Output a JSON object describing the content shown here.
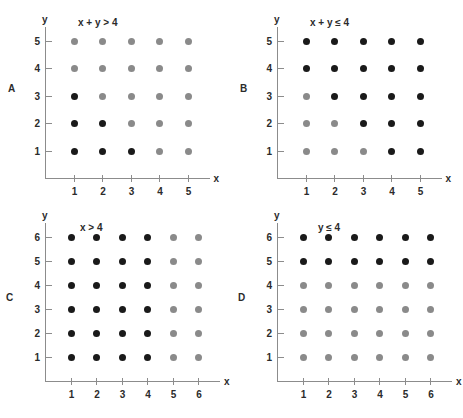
{
  "figure": {
    "width": 463,
    "height": 418,
    "background": "#ffffff",
    "colors": {
      "dot_true": "#1a1a1a",
      "dot_false": "#8a8a8a",
      "axis": "#8c8c8c",
      "text": "#2b2b2b"
    }
  },
  "chart_data": [
    {
      "type": "scatter",
      "panel": "A",
      "panel_label": "A",
      "title": "x + y > 4",
      "xlabel": "x",
      "ylabel": "y",
      "xticks": [
        1,
        2,
        3,
        4,
        5
      ],
      "yticks": [
        1,
        2,
        3,
        4,
        5
      ],
      "xlim": [
        0,
        6
      ],
      "ylim": [
        0,
        6
      ],
      "grid": false,
      "legend": "none",
      "series": [
        {
          "name": "black-dots",
          "color": "#1a1a1a",
          "meaning": "x + y <= 4",
          "points": [
            [
              1,
              1
            ],
            [
              2,
              1
            ],
            [
              3,
              1
            ],
            [
              1,
              2
            ],
            [
              2,
              2
            ],
            [
              1,
              3
            ]
          ]
        },
        {
          "name": "gray-dots",
          "color": "#8a8a8a",
          "meaning": "x + y > 4",
          "points": [
            [
              4,
              1
            ],
            [
              5,
              1
            ],
            [
              3,
              2
            ],
            [
              4,
              2
            ],
            [
              5,
              2
            ],
            [
              2,
              3
            ],
            [
              3,
              3
            ],
            [
              4,
              3
            ],
            [
              5,
              3
            ],
            [
              1,
              4
            ],
            [
              2,
              4
            ],
            [
              3,
              4
            ],
            [
              4,
              4
            ],
            [
              5,
              4
            ],
            [
              1,
              5
            ],
            [
              2,
              5
            ],
            [
              3,
              5
            ],
            [
              4,
              5
            ],
            [
              5,
              5
            ]
          ]
        }
      ]
    },
    {
      "type": "scatter",
      "panel": "B",
      "panel_label": "B",
      "title": "x + y ≤ 4",
      "xlabel": "x",
      "ylabel": "y",
      "xticks": [
        1,
        2,
        3,
        4,
        5
      ],
      "yticks": [
        1,
        2,
        3,
        4,
        5
      ],
      "xlim": [
        0,
        6
      ],
      "ylim": [
        0,
        6
      ],
      "grid": false,
      "legend": "none",
      "series": [
        {
          "name": "black-dots",
          "color": "#1a1a1a",
          "meaning": "x + y > 4",
          "points": [
            [
              4,
              1
            ],
            [
              5,
              1
            ],
            [
              3,
              2
            ],
            [
              4,
              2
            ],
            [
              5,
              2
            ],
            [
              2,
              3
            ],
            [
              3,
              3
            ],
            [
              4,
              3
            ],
            [
              5,
              3
            ],
            [
              1,
              4
            ],
            [
              2,
              4
            ],
            [
              3,
              4
            ],
            [
              4,
              4
            ],
            [
              5,
              4
            ],
            [
              1,
              5
            ],
            [
              2,
              5
            ],
            [
              3,
              5
            ],
            [
              4,
              5
            ],
            [
              5,
              5
            ]
          ]
        },
        {
          "name": "gray-dots",
          "color": "#8a8a8a",
          "meaning": "x + y <= 4",
          "points": [
            [
              1,
              1
            ],
            [
              2,
              1
            ],
            [
              3,
              1
            ],
            [
              1,
              2
            ],
            [
              2,
              2
            ],
            [
              1,
              3
            ]
          ]
        }
      ]
    },
    {
      "type": "scatter",
      "panel": "C",
      "panel_label": "C",
      "title": "x > 4",
      "xlabel": "x",
      "ylabel": "y",
      "xticks": [
        1,
        2,
        3,
        4,
        5,
        6
      ],
      "yticks": [
        1,
        2,
        3,
        4,
        5,
        6
      ],
      "xlim": [
        0,
        7
      ],
      "ylim": [
        0,
        7
      ],
      "grid": false,
      "legend": "none",
      "series": [
        {
          "name": "black-dots",
          "color": "#1a1a1a",
          "meaning": "x <= 4",
          "points": [
            [
              1,
              1
            ],
            [
              2,
              1
            ],
            [
              3,
              1
            ],
            [
              4,
              1
            ],
            [
              1,
              2
            ],
            [
              2,
              2
            ],
            [
              3,
              2
            ],
            [
              4,
              2
            ],
            [
              1,
              3
            ],
            [
              2,
              3
            ],
            [
              3,
              3
            ],
            [
              4,
              3
            ],
            [
              1,
              4
            ],
            [
              2,
              4
            ],
            [
              3,
              4
            ],
            [
              4,
              4
            ],
            [
              1,
              5
            ],
            [
              2,
              5
            ],
            [
              3,
              5
            ],
            [
              4,
              5
            ],
            [
              1,
              6
            ],
            [
              2,
              6
            ],
            [
              3,
              6
            ],
            [
              4,
              6
            ]
          ]
        },
        {
          "name": "gray-dots",
          "color": "#8a8a8a",
          "meaning": "x > 4",
          "points": [
            [
              5,
              1
            ],
            [
              6,
              1
            ],
            [
              5,
              2
            ],
            [
              6,
              2
            ],
            [
              5,
              3
            ],
            [
              6,
              3
            ],
            [
              5,
              4
            ],
            [
              6,
              4
            ],
            [
              5,
              5
            ],
            [
              6,
              5
            ],
            [
              5,
              6
            ],
            [
              6,
              6
            ]
          ]
        }
      ]
    },
    {
      "type": "scatter",
      "panel": "D",
      "panel_label": "D",
      "title": "y ≤ 4",
      "xlabel": "x",
      "ylabel": "y",
      "xticks": [
        1,
        2,
        3,
        4,
        5,
        6
      ],
      "yticks": [
        1,
        2,
        3,
        4,
        5,
        6
      ],
      "xlim": [
        0,
        7
      ],
      "ylim": [
        0,
        7
      ],
      "grid": false,
      "legend": "none",
      "series": [
        {
          "name": "black-dots",
          "color": "#1a1a1a",
          "meaning": "y > 4",
          "points": [
            [
              1,
              5
            ],
            [
              2,
              5
            ],
            [
              3,
              5
            ],
            [
              4,
              5
            ],
            [
              5,
              5
            ],
            [
              6,
              5
            ],
            [
              1,
              6
            ],
            [
              2,
              6
            ],
            [
              3,
              6
            ],
            [
              4,
              6
            ],
            [
              5,
              6
            ],
            [
              6,
              6
            ]
          ]
        },
        {
          "name": "gray-dots",
          "color": "#8a8a8a",
          "meaning": "y <= 4",
          "points": [
            [
              1,
              1
            ],
            [
              2,
              1
            ],
            [
              3,
              1
            ],
            [
              4,
              1
            ],
            [
              5,
              1
            ],
            [
              6,
              1
            ],
            [
              1,
              2
            ],
            [
              2,
              2
            ],
            [
              3,
              2
            ],
            [
              4,
              2
            ],
            [
              5,
              2
            ],
            [
              6,
              2
            ],
            [
              1,
              3
            ],
            [
              2,
              3
            ],
            [
              3,
              3
            ],
            [
              4,
              3
            ],
            [
              5,
              3
            ],
            [
              6,
              3
            ],
            [
              1,
              4
            ],
            [
              2,
              4
            ],
            [
              3,
              4
            ],
            [
              4,
              4
            ],
            [
              5,
              4
            ],
            [
              6,
              4
            ]
          ]
        }
      ]
    }
  ]
}
